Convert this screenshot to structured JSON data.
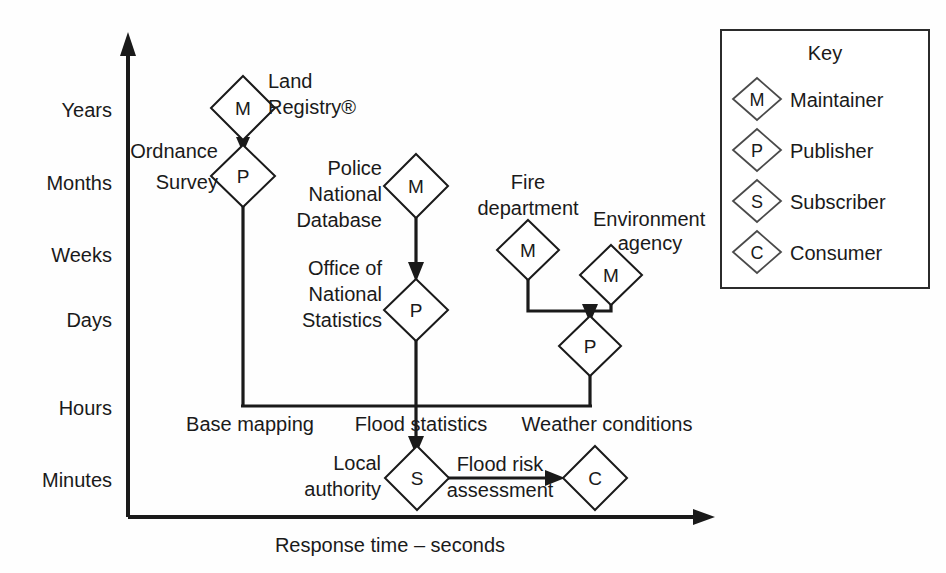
{
  "figure": {
    "background_color": "#fefefe",
    "ink_color": "#1a1a1a"
  },
  "axes": {
    "y_tick_labels": [
      "Years",
      "Months",
      "Weeks",
      "Days",
      "Hours",
      "Minutes"
    ],
    "x_title": "Response time – seconds",
    "y_title": ""
  },
  "nodes": [
    {
      "id": "land-registry",
      "letter": "M",
      "label_lines": [
        "Land",
        "Registry®"
      ]
    },
    {
      "id": "ordnance-survey",
      "letter": "P",
      "label_lines": [
        "Ordnance",
        "Survey"
      ]
    },
    {
      "id": "police-national-database",
      "letter": "M",
      "label_lines": [
        "Police",
        "National",
        "Database"
      ]
    },
    {
      "id": "office-national-statistics",
      "letter": "P",
      "label_lines": [
        "Office of",
        "National",
        "Statistics"
      ]
    },
    {
      "id": "fire-department",
      "letter": "M",
      "label_lines": [
        "Fire",
        "department"
      ]
    },
    {
      "id": "environment-agency",
      "letter": "M",
      "label_lines": [
        "Environment",
        "agency"
      ]
    },
    {
      "id": "weather-publisher",
      "letter": "P",
      "label_lines": []
    },
    {
      "id": "local-authority",
      "letter": "S",
      "label_lines": [
        "Local",
        "authority"
      ]
    },
    {
      "id": "consumer",
      "letter": "C",
      "label_lines": []
    }
  ],
  "flow_labels": {
    "base_mapping": "Base mapping",
    "flood_statistics": "Flood statistics",
    "weather_conditions": "Weather conditions",
    "flood_risk_line1": "Flood risk",
    "flood_risk_line2": "assessment"
  },
  "key": {
    "title": "Key",
    "items": [
      {
        "letter": "M",
        "label": "Maintainer"
      },
      {
        "letter": "P",
        "label": "Publisher"
      },
      {
        "letter": "S",
        "label": "Subscriber"
      },
      {
        "letter": "C",
        "label": "Consumer"
      }
    ]
  }
}
